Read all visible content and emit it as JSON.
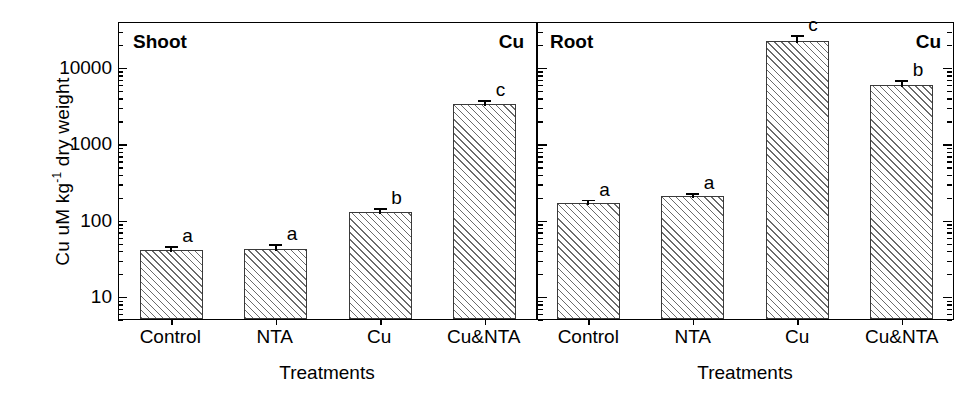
{
  "chart_data": {
    "type": "bar",
    "title": "",
    "xlabel": "Treatments",
    "ylabel": "Cu uM kg-1 dry weight",
    "ylabel_main": "Cu uM kg",
    "ylabel_sup": "-1",
    "ylabel_tail": " dry weight",
    "yscale": "log",
    "ylim": [
      5,
      40000
    ],
    "ytick_labels": [
      "10000",
      "1000",
      "100",
      "10"
    ],
    "ytick_values": [
      10000,
      1000,
      100,
      10
    ],
    "grid": false,
    "legend": "none",
    "categories": [
      "Control",
      "NTA",
      "Cu",
      "Cu&NTA"
    ],
    "panels": [
      {
        "name": "Shoot",
        "title": "Shoot",
        "corner_label": "Cu",
        "values": [
          40,
          41,
          127,
          3300
        ],
        "errors": [
          8,
          10,
          22,
          600
        ],
        "letters": [
          "a",
          "a",
          "b",
          "c"
        ]
      },
      {
        "name": "Root",
        "title": "Root",
        "corner_label": "Cu",
        "values": [
          163,
          205,
          22000,
          5800
        ],
        "errors": [
          32,
          30,
          5500,
          1300
        ],
        "letters": [
          "a",
          "a",
          "c",
          "b"
        ]
      }
    ]
  },
  "axis": {
    "y_title": "Cu uM kg-1 dry weight",
    "x_title": "Treatments"
  }
}
